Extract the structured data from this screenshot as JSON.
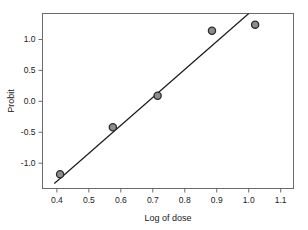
{
  "chart_data": {
    "type": "scatter",
    "title": "",
    "xlabel": "Log of dose",
    "ylabel": "Probit",
    "xlim": [
      0.355,
      1.14
    ],
    "ylim": [
      -1.41,
      1.42
    ],
    "xticks": [
      0.4,
      0.5,
      0.6,
      0.7,
      0.8,
      0.9,
      1.0,
      1.1
    ],
    "xtick_labels": [
      "0.4",
      "0.5",
      "0.6",
      "0.7",
      "0.8",
      "0.9",
      "1.0",
      "1.1"
    ],
    "yticks": [
      1.0,
      0.5,
      0.0,
      -0.5,
      -1.0
    ],
    "ytick_labels": [
      "1.0",
      "0.5",
      "0.0",
      "-0.5",
      "-1.0"
    ],
    "grid": false,
    "legend": null,
    "frame": "box",
    "series": [
      {
        "name": "observed",
        "type": "scatter",
        "marker": "circle",
        "marker_fill": "#8c8c8c",
        "marker_edge": "#2b2b2b",
        "points": [
          {
            "x": 0.41,
            "y": -1.18
          },
          {
            "x": 0.575,
            "y": -0.42
          },
          {
            "x": 0.715,
            "y": 0.09
          },
          {
            "x": 0.885,
            "y": 1.14
          },
          {
            "x": 1.02,
            "y": 1.24
          }
        ]
      },
      {
        "name": "fitted-line",
        "type": "line",
        "color": "#1a1a1a",
        "points": [
          {
            "x": 0.392,
            "y": -1.33
          },
          {
            "x": 1.0,
            "y": 1.42
          }
        ]
      }
    ]
  },
  "axes": {
    "x_title": "Log of dose",
    "y_title": "Probit"
  },
  "colors": {
    "axis": "#6b6b6b",
    "text": "#1a1a1a",
    "line": "#1a1a1a",
    "marker_fill": "#8c8c8c",
    "marker_edge": "#2b2b2b",
    "background": "#ffffff"
  }
}
